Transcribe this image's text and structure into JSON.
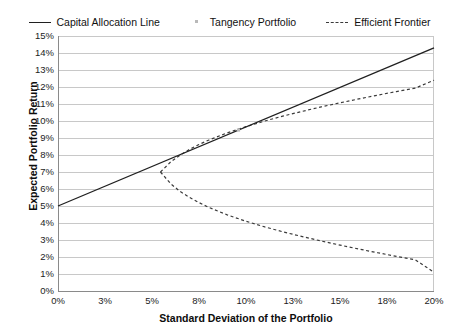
{
  "chart_data": {
    "type": "line",
    "title": "",
    "xlabel": "Standard Deviation of the Portfolio",
    "ylabel": "Expected Portfolio Return",
    "xlim": [
      0,
      20
    ],
    "ylim": [
      0,
      15
    ],
    "grid": "horizontal",
    "legend_position": "top-center",
    "xtick_labels": [
      "0%",
      "3%",
      "5%",
      "8%",
      "10%",
      "13%",
      "15%",
      "18%",
      "20%"
    ],
    "xtick_values": [
      0,
      2.5,
      5,
      7.5,
      10,
      12.5,
      15,
      17.5,
      20
    ],
    "ytick_labels": [
      "0%",
      "1%",
      "2%",
      "3%",
      "4%",
      "5%",
      "6%",
      "7%",
      "8%",
      "9%",
      "10%",
      "11%",
      "12%",
      "13%",
      "14%",
      "15%"
    ],
    "ytick_values": [
      0,
      1,
      2,
      3,
      4,
      5,
      6,
      7,
      8,
      9,
      10,
      11,
      12,
      13,
      14,
      15
    ],
    "series": [
      {
        "name": "Capital Allocation Line",
        "style": "solid",
        "color": "#202020",
        "risk_free_rate": 5.0,
        "slope": 0.465,
        "x": [
          0,
          2.5,
          5,
          7.5,
          10,
          12.5,
          15,
          17.5,
          20
        ],
        "values": [
          5.0,
          6.16,
          7.33,
          8.49,
          9.65,
          10.81,
          11.98,
          13.14,
          14.3
        ]
      },
      {
        "name": "Tangency Portfolio",
        "style": "point",
        "color": "#b9b9b9",
        "x": [
          9.6
        ],
        "values": [
          9.47
        ]
      },
      {
        "name": "Efficient Frontier",
        "style": "dashed",
        "color": "#3a3a3a",
        "minimum_variance_point": {
          "x": 5.45,
          "y": 7.0
        },
        "upper_branch": {
          "x": [
            5.45,
            6.0,
            6.5,
            7.0,
            7.5,
            8.0,
            9.0,
            10.0,
            11.0,
            12.0,
            13.0,
            14.0,
            15.0,
            16.0,
            17.0,
            18.0,
            19.0,
            20.0
          ],
          "values": [
            7.0,
            7.6,
            8.0,
            8.33,
            8.62,
            8.87,
            9.3,
            9.67,
            10.0,
            10.3,
            10.57,
            10.83,
            11.07,
            11.3,
            11.52,
            11.73,
            11.93,
            12.4
          ]
        },
        "lower_branch": {
          "x": [
            5.45,
            6.0,
            6.5,
            7.0,
            7.5,
            8.0,
            9.0,
            10.0,
            11.0,
            12.0,
            13.0,
            14.0,
            15.0,
            16.0,
            17.0,
            18.0,
            19.0,
            20.0
          ],
          "values": [
            7.0,
            6.3,
            5.85,
            5.5,
            5.2,
            4.93,
            4.48,
            4.1,
            3.77,
            3.47,
            3.2,
            2.94,
            2.7,
            2.47,
            2.25,
            2.04,
            1.84,
            1.1
          ]
        }
      }
    ]
  },
  "legend": {
    "items": [
      {
        "label": "Capital Allocation Line",
        "marker": "solid-line-marker"
      },
      {
        "label": "Tangency Portfolio",
        "marker": "point-marker"
      },
      {
        "label": "Efficient Frontier",
        "marker": "dashed-line-marker"
      }
    ]
  },
  "axes": {
    "x_title": "Standard Deviation of the Portfolio",
    "y_title": "Expected Portfolio Return"
  },
  "colors": {
    "cal_line": "#202020",
    "frontier_line": "#3a3a3a",
    "tangency_point": "#b9b9b9",
    "gridline": "#c8c8c8",
    "axis": "#8a8a8a",
    "background": "#ffffff"
  }
}
